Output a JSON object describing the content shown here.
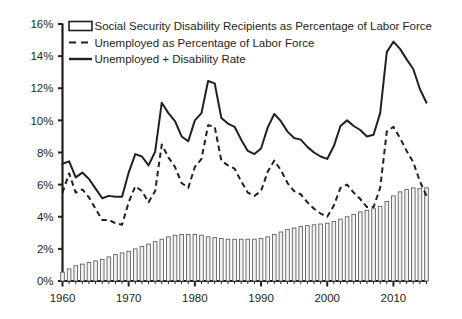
{
  "chart_data": {
    "type": "line",
    "title": "",
    "subtitle": "",
    "xlabel": "",
    "ylabel": "",
    "xlim": [
      1960,
      2015
    ],
    "ylim": [
      0,
      16
    ],
    "grid": false,
    "legend_position": "top-left",
    "y_ticks": [
      "0%",
      "2%",
      "4%",
      "6%",
      "8%",
      "10%",
      "12%",
      "14%",
      "16%"
    ],
    "y_tick_values": [
      0,
      2,
      4,
      6,
      8,
      10,
      12,
      14,
      16
    ],
    "x_ticks": [
      "1960",
      "1970",
      "1980",
      "1990",
      "2000",
      "2010"
    ],
    "x_tick_values": [
      1960,
      1970,
      1980,
      1990,
      2000,
      2010
    ],
    "x_minor_tick_step": 1,
    "units": "percent",
    "x": [
      1960,
      1961,
      1962,
      1963,
      1964,
      1965,
      1966,
      1967,
      1968,
      1969,
      1970,
      1971,
      1972,
      1973,
      1974,
      1975,
      1976,
      1977,
      1978,
      1979,
      1980,
      1981,
      1982,
      1983,
      1984,
      1985,
      1986,
      1987,
      1988,
      1989,
      1990,
      1991,
      1992,
      1993,
      1994,
      1995,
      1996,
      1997,
      1998,
      1999,
      2000,
      2001,
      2002,
      2003,
      2004,
      2005,
      2006,
      2007,
      2008,
      2009,
      2010,
      2011,
      2012,
      2013,
      2014,
      2015
    ],
    "series": [
      {
        "name": "Social Security Disability Recipients as Percentage of Labor Force",
        "key": "disability_bars",
        "render": "bar",
        "marker": "outlined-rectangle",
        "values": [
          0.55,
          0.75,
          0.95,
          1.05,
          1.15,
          1.25,
          1.35,
          1.5,
          1.65,
          1.75,
          1.85,
          2.0,
          2.15,
          2.3,
          2.45,
          2.6,
          2.75,
          2.85,
          2.9,
          2.9,
          2.9,
          2.85,
          2.75,
          2.7,
          2.65,
          2.6,
          2.6,
          2.6,
          2.6,
          2.6,
          2.65,
          2.75,
          2.9,
          3.05,
          3.2,
          3.3,
          3.4,
          3.45,
          3.5,
          3.55,
          3.6,
          3.7,
          3.85,
          4.0,
          4.15,
          4.3,
          4.4,
          4.5,
          4.65,
          4.95,
          5.3,
          5.55,
          5.7,
          5.8,
          5.75,
          5.8
        ]
      },
      {
        "name": "Unemployed as Percentage of Labor Force",
        "key": "unemployment_line",
        "render": "line",
        "style": "dashed",
        "values": [
          5.5,
          6.7,
          5.5,
          5.7,
          5.2,
          4.5,
          3.8,
          3.8,
          3.6,
          3.5,
          4.9,
          5.9,
          5.6,
          4.9,
          5.6,
          8.5,
          7.7,
          7.1,
          6.1,
          5.8,
          7.1,
          7.6,
          9.7,
          9.6,
          7.5,
          7.2,
          7.0,
          6.2,
          5.5,
          5.3,
          5.6,
          6.8,
          7.5,
          6.9,
          6.1,
          5.6,
          5.4,
          4.9,
          4.5,
          4.2,
          4.0,
          4.7,
          5.8,
          6.0,
          5.5,
          5.1,
          4.6,
          4.6,
          5.8,
          9.3,
          9.6,
          8.9,
          8.1,
          7.4,
          6.2,
          5.3
        ]
      },
      {
        "name": "Unemployed + Disability Rate",
        "key": "combined_line",
        "render": "line",
        "style": "solid",
        "values": [
          7.3,
          7.45,
          6.45,
          6.75,
          6.35,
          5.75,
          5.15,
          5.3,
          5.25,
          5.25,
          6.75,
          7.9,
          7.75,
          7.2,
          8.05,
          11.1,
          10.45,
          9.95,
          9.0,
          8.7,
          10.0,
          10.45,
          12.45,
          12.3,
          10.15,
          9.8,
          9.6,
          8.8,
          8.1,
          7.9,
          8.25,
          9.55,
          10.4,
          9.95,
          9.3,
          8.9,
          8.8,
          8.35,
          8.0,
          7.75,
          7.6,
          8.4,
          9.65,
          10.0,
          9.65,
          9.4,
          9.0,
          9.1,
          10.45,
          14.25,
          14.9,
          14.45,
          13.8,
          13.2,
          11.95,
          11.1
        ]
      }
    ],
    "legend": [
      {
        "label": "Social Security Disability Recipients as Percentage of Labor Force",
        "swatch": "outlined-rectangle"
      },
      {
        "label": "Unemployed as Percentage of Labor Force",
        "swatch": "dashed-line"
      },
      {
        "label": "Unemployed + Disability Rate",
        "swatch": "solid-line"
      }
    ],
    "colors": {
      "line": "#231f20",
      "bar_fill": "#f2f2f2",
      "bar_stroke": "#58595b",
      "axis": "#231f20",
      "background": "#ffffff",
      "text": "#231f20"
    }
  }
}
